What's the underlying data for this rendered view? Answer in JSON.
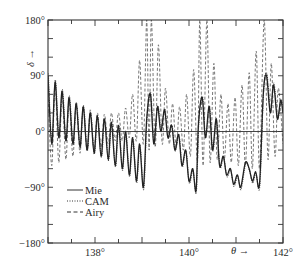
{
  "chart_data": {
    "type": "line",
    "title": "",
    "xlabel": "θ →",
    "ylabel": "δ →",
    "xlim": [
      137,
      142
    ],
    "ylim": [
      -180,
      180
    ],
    "x_ticks": [
      {
        "value": 138,
        "label": "138°"
      },
      {
        "value": 140,
        "label": "140°"
      },
      {
        "value": 142,
        "label": "142°"
      }
    ],
    "x_minor_tick_step": 0.5,
    "y_ticks": [
      {
        "value": 180,
        "label": "180°"
      },
      {
        "value": 90,
        "label": "90°"
      },
      {
        "value": 0,
        "label": "0°"
      },
      {
        "value": -90,
        "label": "−90°"
      },
      {
        "value": -180,
        "label": "−180°"
      }
    ],
    "y_minor_tick_step": 30,
    "grid": false,
    "zero_line": true,
    "legend": {
      "position": "lower-left",
      "entries": [
        {
          "name": "Mie",
          "style": "solid"
        },
        {
          "name": "CAM",
          "style": "dotted"
        },
        {
          "name": "Airy",
          "style": "dashed"
        }
      ]
    },
    "series": [
      {
        "name": "Mie",
        "style": "solid",
        "description": "Phase shift oscillating with period ~0.15°; peaks decay from ~90° at 137° to ~20° near 138.8°, troughs descend to ~−90° near 139.1° and ~−105° near 140.4°; peaks rise again to ~60° at 139.2°, ~40° at 140.3°, ~80° at 141.6°, ~−70° trough near 141.5°",
        "points": [
          [
            137.0,
            90
          ],
          [
            137.08,
            -20
          ],
          [
            137.15,
            80
          ],
          [
            137.23,
            -10
          ],
          [
            137.3,
            65
          ],
          [
            137.38,
            -15
          ],
          [
            137.45,
            55
          ],
          [
            137.53,
            -20
          ],
          [
            137.6,
            45
          ],
          [
            137.68,
            -25
          ],
          [
            137.75,
            40
          ],
          [
            137.83,
            -30
          ],
          [
            137.9,
            30
          ],
          [
            137.98,
            -35
          ],
          [
            138.05,
            25
          ],
          [
            138.13,
            -40
          ],
          [
            138.2,
            20
          ],
          [
            138.28,
            -45
          ],
          [
            138.35,
            15
          ],
          [
            138.43,
            -55
          ],
          [
            138.5,
            10
          ],
          [
            138.58,
            -60
          ],
          [
            138.65,
            0
          ],
          [
            138.73,
            -70
          ],
          [
            138.8,
            -10
          ],
          [
            138.88,
            -80
          ],
          [
            138.95,
            -20
          ],
          [
            139.03,
            -90
          ],
          [
            139.1,
            20
          ],
          [
            139.18,
            60
          ],
          [
            139.25,
            -20
          ],
          [
            139.33,
            40
          ],
          [
            139.4,
            0
          ],
          [
            139.48,
            35
          ],
          [
            139.55,
            -10
          ],
          [
            139.63,
            10
          ],
          [
            139.7,
            -30
          ],
          [
            139.78,
            -5
          ],
          [
            139.85,
            -55
          ],
          [
            139.93,
            -30
          ],
          [
            140.0,
            -80
          ],
          [
            140.08,
            -60
          ],
          [
            140.15,
            -95
          ],
          [
            140.2,
            10
          ],
          [
            140.28,
            55
          ],
          [
            140.35,
            -10
          ],
          [
            140.43,
            40
          ],
          [
            140.5,
            -30
          ],
          [
            140.58,
            20
          ],
          [
            140.65,
            -55
          ],
          [
            140.73,
            -40
          ],
          [
            140.8,
            -70
          ],
          [
            140.88,
            -60
          ],
          [
            140.95,
            -85
          ],
          [
            141.03,
            -70
          ],
          [
            141.1,
            -90
          ],
          [
            141.2,
            -50
          ],
          [
            141.28,
            -60
          ],
          [
            141.35,
            -80
          ],
          [
            141.42,
            -65
          ],
          [
            141.5,
            -85
          ],
          [
            141.58,
            60
          ],
          [
            141.65,
            90
          ],
          [
            141.73,
            30
          ],
          [
            141.8,
            75
          ],
          [
            141.88,
            20
          ],
          [
            141.95,
            50
          ],
          [
            142.0,
            30
          ]
        ]
      },
      {
        "name": "CAM",
        "style": "dotted",
        "description": "Closely follows the Mie curve throughout the range"
      },
      {
        "name": "Airy",
        "style": "dashed",
        "description": "Oscillates with larger amplitude around 0°, troughs near −60° on the left; growing peaks reach 180° (wrapping) near 139.2°, 140.4° and 141.6°",
        "points": [
          [
            137.0,
            60
          ],
          [
            137.08,
            -55
          ],
          [
            137.15,
            75
          ],
          [
            137.23,
            -50
          ],
          [
            137.3,
            60
          ],
          [
            137.38,
            -45
          ],
          [
            137.45,
            50
          ],
          [
            137.53,
            -40
          ],
          [
            137.6,
            45
          ],
          [
            137.68,
            -35
          ],
          [
            137.75,
            40
          ],
          [
            137.83,
            -30
          ],
          [
            137.9,
            35
          ],
          [
            137.98,
            -30
          ],
          [
            138.05,
            30
          ],
          [
            138.13,
            -25
          ],
          [
            138.2,
            28
          ],
          [
            138.28,
            -20
          ],
          [
            138.35,
            30
          ],
          [
            138.43,
            -15
          ],
          [
            138.5,
            30
          ],
          [
            138.58,
            -15
          ],
          [
            138.65,
            38
          ],
          [
            138.73,
            -10
          ],
          [
            138.8,
            60
          ],
          [
            138.88,
            -15
          ],
          [
            138.95,
            115
          ],
          [
            139.03,
            -20
          ],
          [
            139.1,
            180
          ],
          [
            139.15,
            -30
          ],
          [
            139.2,
            180
          ],
          [
            139.28,
            -25
          ],
          [
            139.35,
            140
          ],
          [
            139.43,
            -20
          ],
          [
            139.5,
            70
          ],
          [
            139.58,
            -20
          ],
          [
            139.65,
            45
          ],
          [
            139.73,
            -25
          ],
          [
            139.8,
            40
          ],
          [
            139.88,
            -30
          ],
          [
            139.95,
            60
          ],
          [
            140.03,
            -40
          ],
          [
            140.1,
            100
          ],
          [
            140.18,
            -50
          ],
          [
            140.23,
            180
          ],
          [
            140.3,
            -55
          ],
          [
            140.38,
            180
          ],
          [
            140.45,
            -50
          ],
          [
            140.53,
            110
          ],
          [
            140.6,
            -45
          ],
          [
            140.68,
            60
          ],
          [
            140.75,
            -45
          ],
          [
            140.83,
            45
          ],
          [
            140.9,
            -50
          ],
          [
            140.98,
            55
          ],
          [
            141.05,
            -55
          ],
          [
            141.13,
            75
          ],
          [
            141.2,
            -55
          ],
          [
            141.28,
            95
          ],
          [
            141.35,
            -60
          ],
          [
            141.43,
            130
          ],
          [
            141.5,
            -60
          ],
          [
            141.6,
            180
          ],
          [
            141.68,
            -45
          ],
          [
            141.75,
            110
          ],
          [
            141.83,
            -40
          ],
          [
            141.9,
            70
          ],
          [
            142.0,
            -20
          ]
        ]
      }
    ]
  }
}
